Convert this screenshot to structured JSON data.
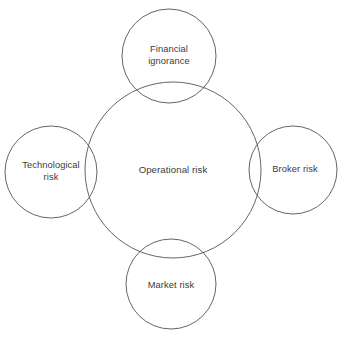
{
  "diagram": {
    "type": "venn-overlapping-circles",
    "stroke_color": "#51545a",
    "background_color": "#ffffff",
    "text_color": "#3a3a3a",
    "center": {
      "id": "operational-risk",
      "label": "Operational risk",
      "lines": [
        "Operational risk"
      ],
      "cx": 173,
      "cy": 170,
      "r": 88
    },
    "satellites": [
      {
        "id": "financial-ignorance",
        "label": "Financial ignorance",
        "lines": [
          "Financial",
          "ignorance"
        ],
        "position": "top",
        "cx": 169,
        "cy": 56,
        "r": 47
      },
      {
        "id": "technological-risk",
        "label": "Technological risk",
        "lines": [
          "Technological",
          "risk"
        ],
        "position": "left",
        "cx": 51,
        "cy": 172,
        "r": 46
      },
      {
        "id": "broker-risk",
        "label": "Broker risk",
        "lines": [
          "Broker risk"
        ],
        "position": "right",
        "cx": 293,
        "cy": 170,
        "r": 44
      },
      {
        "id": "market-risk",
        "label": "Market risk",
        "lines": [
          "Market risk"
        ],
        "position": "bottom",
        "cx": 171,
        "cy": 284,
        "r": 45
      }
    ]
  }
}
